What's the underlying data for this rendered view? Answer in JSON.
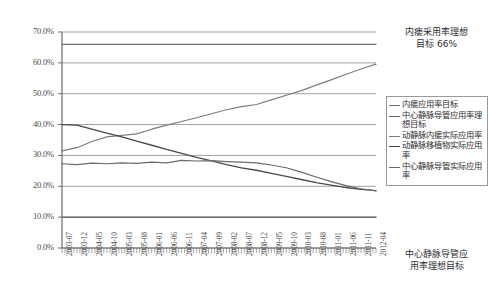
{
  "chart_data": {
    "type": "line",
    "title": "",
    "xlabel": "",
    "ylabel": "",
    "ylim": [
      0,
      0.7
    ],
    "ytick_labels": [
      "70.0%",
      "60.0%",
      "50.0%",
      "40.0%",
      "30.0%",
      "20.0%",
      "10.0%",
      "0.0%"
    ],
    "ytick_values": [
      70,
      60,
      50,
      40,
      30,
      20,
      10,
      0
    ],
    "grid": true,
    "legend_position": "right",
    "x": [
      "2003-07",
      "2003-12",
      "2004-05",
      "2004-10",
      "2005-03",
      "2005-08",
      "2006-01",
      "2006-06",
      "2006-11",
      "2007-04",
      "2007-09",
      "2008-02",
      "2008-07",
      "2008-12",
      "2009-05",
      "2009-10",
      "2010-03",
      "2010-08",
      "2011-01",
      "2011-06",
      "2011-11",
      "2012-04"
    ],
    "series": [
      {
        "name": "内瘘应用率目标",
        "color": "#6f6f6f",
        "width": 1.4,
        "values": [
          66,
          66,
          66,
          66,
          66,
          66,
          66,
          66,
          66,
          66,
          66,
          66,
          66,
          66,
          66,
          66,
          66,
          66,
          66,
          66,
          66,
          66
        ]
      },
      {
        "name": "中心静脉导管应用率理想目标",
        "color": "#6f6f6f",
        "width": 1.5,
        "values": [
          10,
          10,
          10,
          10,
          10,
          10,
          10,
          10,
          10,
          10,
          10,
          10,
          10,
          10,
          10,
          10,
          10,
          10,
          10,
          10,
          10,
          10
        ]
      },
      {
        "name": "动静脉内瘘实际应用率",
        "color": "#7d7d7d",
        "width": 1.2,
        "values": [
          31.5,
          32.5,
          34.5,
          36.0,
          36.5,
          37.0,
          38.5,
          39.8,
          41.0,
          42.2,
          43.5,
          44.8,
          45.8,
          46.5,
          48.0,
          49.5,
          51.0,
          52.8,
          54.5,
          56.3,
          58.0,
          59.6
        ]
      },
      {
        "name": "动静脉移植物实际应用率",
        "color": "#4a4a4a",
        "width": 1.3,
        "values": [
          40.0,
          39.8,
          38.5,
          37.2,
          36.0,
          34.6,
          33.3,
          32.0,
          30.7,
          29.4,
          28.2,
          27.0,
          26.0,
          25.2,
          24.2,
          23.2,
          22.2,
          21.2,
          20.4,
          19.6,
          19.0,
          18.6
        ]
      },
      {
        "name": "中心静脉导管实际应用率",
        "color": "#6a6a6a",
        "width": 1.2,
        "values": [
          27.3,
          27.0,
          27.5,
          27.3,
          27.6,
          27.4,
          27.8,
          27.6,
          28.4,
          28.2,
          28.3,
          28.0,
          27.8,
          27.6,
          26.9,
          26.0,
          24.6,
          23.0,
          21.5,
          20.2,
          19.2,
          18.5
        ]
      }
    ],
    "annotations": [
      {
        "name": "target-note-top",
        "text": "内瘘采用率理想\n目标 66%"
      },
      {
        "name": "target-note-bottom",
        "text": "中心静脉导管应\n用率理想目标"
      }
    ]
  },
  "notes": {
    "top_line1": "内瘘采用率理想",
    "top_line2": "目标 66%",
    "bottom_line1": "中心静脉导管应",
    "bottom_line2": "用率理想目标"
  },
  "colors": {
    "axis": "#6b6b6b",
    "grid": "#8a8a8a",
    "text": "#3b3b3b",
    "legend_border": "#9a9a9a",
    "background": "#ffffff"
  }
}
